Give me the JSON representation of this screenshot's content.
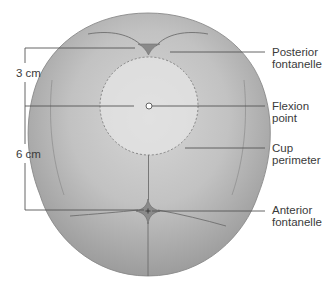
{
  "figure": {
    "type": "anatomical-diagram",
    "colors": {
      "skull_fill": "#a8a8a8",
      "skull_highlight": "#d8d8d8",
      "suture_line": "#6e6e6e",
      "fontanelle_fill": "#8a8a8a",
      "cup_fill": "#e6e6e6",
      "cup_outline": "#7a7a7a",
      "leader_line": "#555555",
      "text": "#3a3a3a"
    }
  },
  "measurements": {
    "upper": {
      "label": "3 cm"
    },
    "lower": {
      "label": "6 cm"
    }
  },
  "labels": {
    "posterior_fontanelle": {
      "line1": "Posterior",
      "line2": "fontanelle"
    },
    "flexion_point": {
      "line1": "Flexion",
      "line2": "point"
    },
    "cup_perimeter": {
      "line1": "Cup",
      "line2": "perimeter"
    },
    "anterior_fontanelle": {
      "line1": "Anterior",
      "line2": "fontanelle"
    }
  }
}
